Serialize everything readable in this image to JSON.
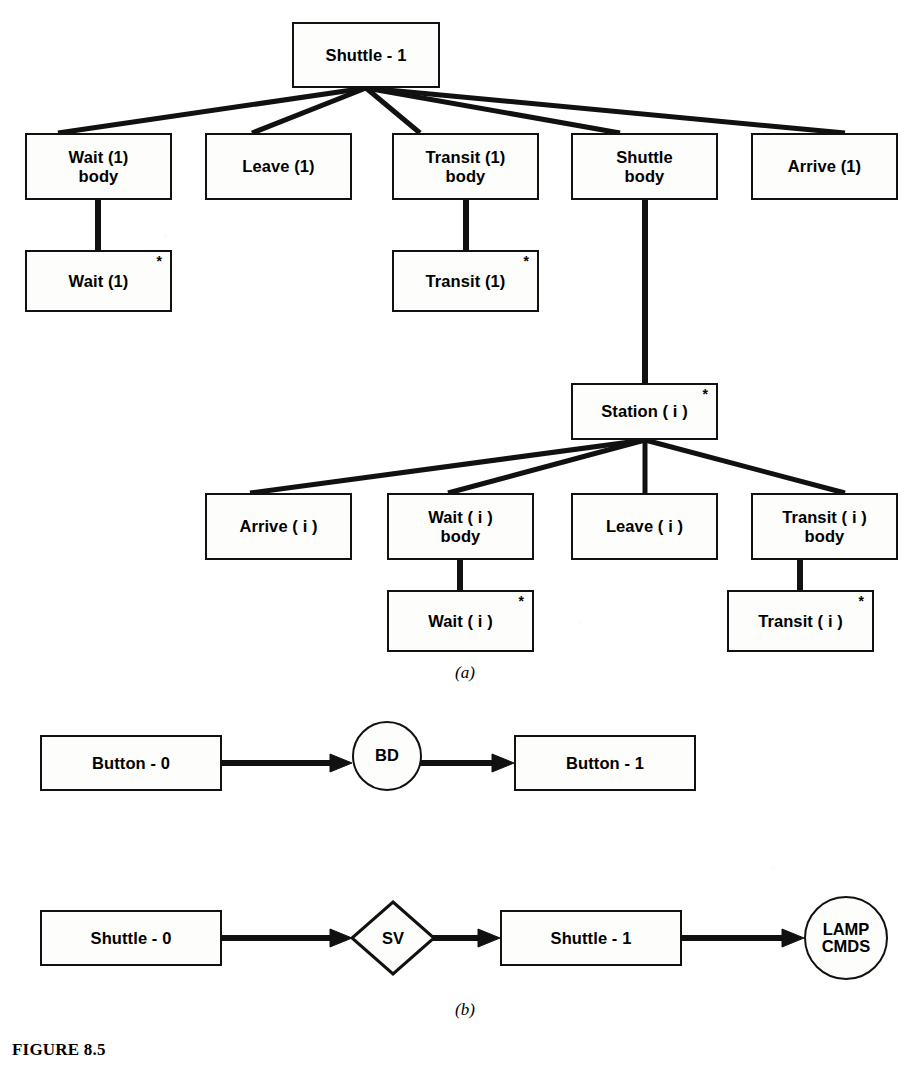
{
  "figure": {
    "caption": "FIGURE 8.5",
    "part_a_label": "(a)",
    "part_b_label": "(b)",
    "ink_color": "#111111",
    "paper_color": "#ffffff"
  },
  "tree": {
    "root": {
      "label": "Shuttle - 1",
      "star": ""
    },
    "level2": [
      {
        "label": "Wait (1)\nbody",
        "star": ""
      },
      {
        "label": "Leave (1)",
        "star": ""
      },
      {
        "label": "Transit (1)\nbody",
        "star": ""
      },
      {
        "label": "Shuttle\nbody",
        "star": ""
      },
      {
        "label": "Arrive (1)",
        "star": ""
      }
    ],
    "level3": [
      {
        "label": "Wait (1)",
        "star": "*"
      },
      {
        "label": "Transit (1)",
        "star": "*"
      }
    ],
    "station": {
      "label": "Station ( i )",
      "star": "*"
    },
    "station_children": [
      {
        "label": "Arrive ( i )",
        "star": ""
      },
      {
        "label": "Wait ( i )\nbody",
        "star": ""
      },
      {
        "label": "Leave ( i )",
        "star": ""
      },
      {
        "label": "Transit  ( i )\nbody",
        "star": ""
      }
    ],
    "station_grandchildren": [
      {
        "label": "Wait ( i )",
        "star": "*"
      },
      {
        "label": "Transit ( i )",
        "star": "*"
      }
    ]
  },
  "flow_button": {
    "source": {
      "label": "Button - 0"
    },
    "process": {
      "label": "BD"
    },
    "target": {
      "label": "Button - 1"
    }
  },
  "flow_shuttle": {
    "source": {
      "label": "Shuttle - 0"
    },
    "process": {
      "label": "SV"
    },
    "middle": {
      "label": "Shuttle - 1"
    },
    "sink": {
      "label": "LAMP\nCMDS"
    }
  }
}
